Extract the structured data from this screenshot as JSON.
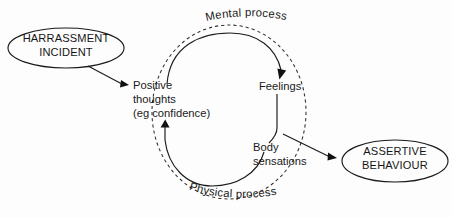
{
  "diagram": {
    "background_color": "#fdfdfd",
    "line_color": "#1b1b1b",
    "text_color": "#1a1a1a",
    "nodes": {
      "trigger": {
        "shape": "ellipse",
        "line1": "HARRASSMENT",
        "line2": "INCIDENT"
      },
      "outcome": {
        "shape": "ellipse",
        "line1": "ASSERTIVE",
        "line2": "BEHAVIOUR"
      },
      "thoughts": {
        "line1": "Positive",
        "line2": "thoughts",
        "line3": "(eg confidence)"
      },
      "feelings": {
        "line1": "Feelings"
      },
      "body": {
        "line1": "Body",
        "line2": "sensations"
      }
    },
    "cycle_labels": {
      "top": "Mental process",
      "bottom": "Physical process"
    }
  }
}
